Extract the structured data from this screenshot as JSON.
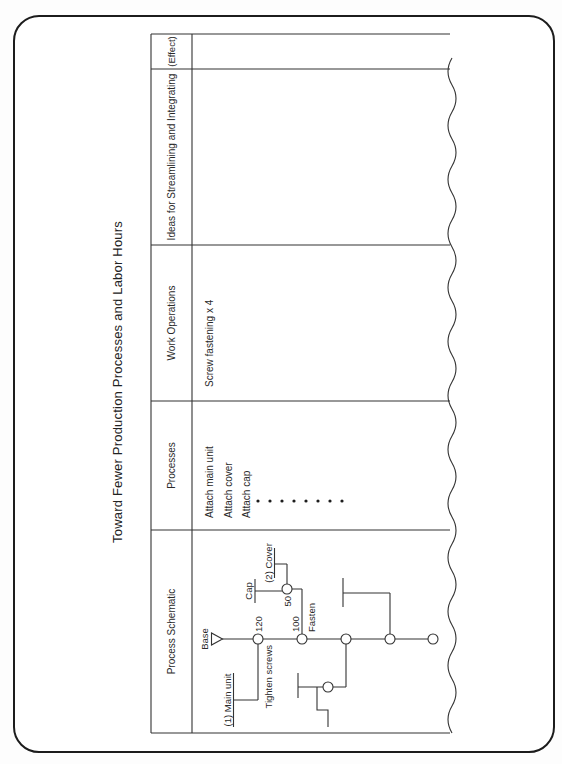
{
  "title": "Toward Fewer Production Processes and Labor Hours",
  "table": {
    "headers": [
      "Process Schematic",
      "Processes",
      "Work Operations",
      "Ideas for Streamlining and Integrating",
      "(Effect)"
    ],
    "processes_cell": [
      "Attach main unit",
      "Attach cover",
      "Attach cap"
    ],
    "work_operations_cell": "Screw fastening x 4",
    "ideas_cell": "",
    "effect_cell": ""
  },
  "schematic": {
    "base": "Base",
    "main_unit": "(1) Main unit",
    "tighten_screws": "Tighten screws",
    "time_first": "120",
    "time_second": "100",
    "fasten": "Fasten",
    "time_branch": "50",
    "cap": "Cap",
    "cover": "(2) Cover"
  },
  "colors": {
    "ink": "#2a2a2a",
    "paper": "#ffffff"
  }
}
